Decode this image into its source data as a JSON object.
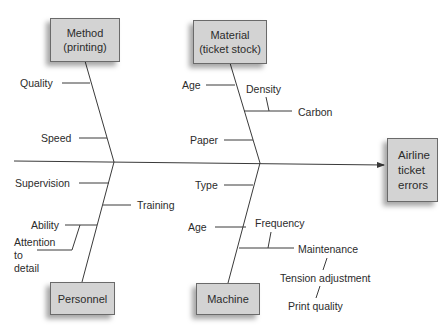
{
  "diagram": {
    "type": "fishbone (cause-and-effect)",
    "effect": "Airline\nticket\nerrors",
    "categories": {
      "method": {
        "title": "Method\n(printing)",
        "causes": [
          "Quality",
          "Speed"
        ]
      },
      "material": {
        "title": "Material\n(ticket stock)",
        "causes": [
          "Age",
          "Density",
          "Carbon",
          "Paper"
        ]
      },
      "personnel": {
        "title": "Personnel",
        "causes": [
          "Supervision",
          "Training",
          "Ability",
          "Attention to detail"
        ]
      },
      "machine": {
        "title": "Machine",
        "causes": [
          "Type",
          "Age",
          "Frequency",
          "Maintenance",
          "Tension adjustment",
          "Print quality"
        ]
      }
    },
    "labels": {
      "attention": "Attention\nto\ndetail"
    },
    "colors": {
      "box_fill": "#d3d3d3",
      "box_border": "#6a6a6a",
      "line": "#3a3a3a",
      "text": "#2b2b2b"
    }
  }
}
